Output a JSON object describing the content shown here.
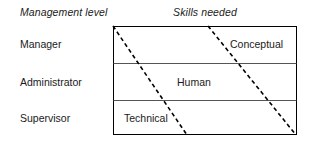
{
  "figure": {
    "headers": {
      "left": "Management level",
      "right": "Skills needed"
    },
    "levels": [
      {
        "label": "Manager"
      },
      {
        "label": "Administrator"
      },
      {
        "label": "Supervisor"
      }
    ],
    "skills": [
      {
        "label": "Conceptual"
      },
      {
        "label": "Human"
      },
      {
        "label": "Technical"
      }
    ],
    "colors": {
      "text": "#1a1a1a",
      "border": "#000000",
      "divider": "#555555",
      "dashed": "#000000",
      "background": "#ffffff"
    },
    "geometry": {
      "box": {
        "x": 113,
        "y": 26,
        "width": 184,
        "height": 109
      },
      "dividers_y": [
        63,
        100
      ],
      "dashed_lines": [
        {
          "x1": 113,
          "y1": 26,
          "x2": 187,
          "y2": 135
        },
        {
          "x1": 208,
          "y1": 26,
          "x2": 296,
          "y2": 135
        }
      ],
      "dash_pattern": "4 3",
      "stroke_width": 1
    }
  }
}
